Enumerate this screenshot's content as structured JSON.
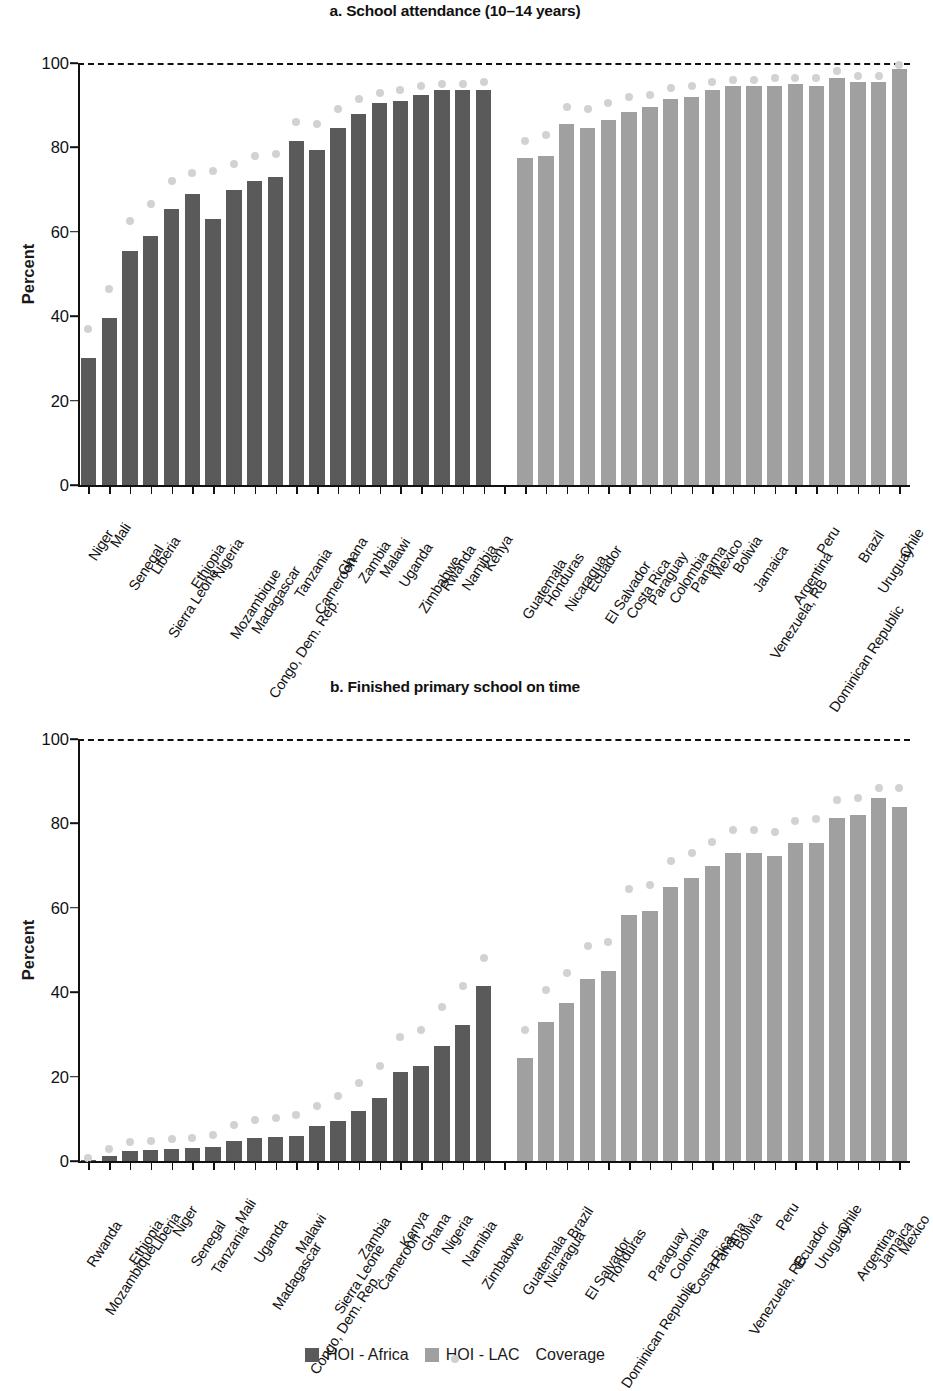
{
  "figure": {
    "ylabel": "Percent",
    "yticks": [
      "0",
      "20",
      "40",
      "60",
      "80",
      "100"
    ],
    "legend": [
      {
        "key": "africa",
        "label": "HOI - Africa",
        "color": "#5a5a5a",
        "marker": "square"
      },
      {
        "key": "lac",
        "label": "HOI - LAC",
        "color": "#a0a0a0",
        "marker": "square"
      },
      {
        "key": "coverage",
        "label": "Coverage",
        "color": "#cfcfcf",
        "marker": "dot"
      }
    ]
  },
  "chart_data": [
    {
      "type": "bar",
      "id": "panel-a",
      "title": "a. School attendance (10–14 years)",
      "xlabel": "",
      "ylabel": "Percent",
      "ylim": [
        0,
        100
      ],
      "yticks": [
        0,
        20,
        40,
        60,
        80,
        100
      ],
      "grid": false,
      "reference_line": 100,
      "legend_position": "bottom",
      "categories": [
        "Niger",
        "Mali",
        "Senegal",
        "Liberia",
        "Sierra Leone",
        "Ethiopia",
        "Nigeria",
        "Mozambique",
        "Madagascar",
        "Congo, Dem. Rep.",
        "Tanzania",
        "Cameroon",
        "Ghana",
        "Zambia",
        "Malawi",
        "Uganda",
        "Zimbabwe",
        "Rwanda",
        "Namibia",
        "Kenya",
        "",
        "Guatemala",
        "Honduras",
        "Nicaragua",
        "Ecuador",
        "El Salvador",
        "Costa Rica",
        "Paraguay",
        "Colombia",
        "Panama",
        "Mexico",
        "Bolivia",
        "Jamaica",
        "Venezuela, RB",
        "Argentina",
        "Peru",
        "Dominican Republic",
        "Brazil",
        "Uruguay",
        "Chile"
      ],
      "groups": [
        "africa",
        "africa",
        "africa",
        "africa",
        "africa",
        "africa",
        "africa",
        "africa",
        "africa",
        "africa",
        "africa",
        "africa",
        "africa",
        "africa",
        "africa",
        "africa",
        "africa",
        "africa",
        "africa",
        "africa",
        "gap",
        "lac",
        "lac",
        "lac",
        "lac",
        "lac",
        "lac",
        "lac",
        "lac",
        "lac",
        "lac",
        "lac",
        "lac",
        "lac",
        "lac",
        "lac",
        "lac",
        "lac",
        "lac",
        "lac"
      ],
      "series": [
        {
          "name": "HOI",
          "values": [
            30.0,
            39.5,
            55.5,
            59.0,
            65.5,
            69.0,
            63.0,
            70.0,
            72.0,
            73.0,
            81.5,
            79.5,
            84.5,
            88.0,
            90.5,
            91.0,
            92.5,
            93.5,
            93.5,
            93.5,
            null,
            77.5,
            78.0,
            85.5,
            84.5,
            86.5,
            88.5,
            89.5,
            91.5,
            92.0,
            93.5,
            94.5,
            94.5,
            94.5,
            95.0,
            94.5,
            96.5,
            95.5,
            95.5,
            98.5
          ]
        },
        {
          "name": "Coverage",
          "values": [
            37.0,
            46.5,
            62.5,
            66.5,
            72.0,
            74.0,
            74.5,
            76.0,
            78.0,
            78.5,
            86.0,
            85.5,
            89.0,
            91.5,
            93.0,
            93.5,
            94.5,
            95.0,
            95.0,
            95.5,
            null,
            81.5,
            83.0,
            89.5,
            89.0,
            90.5,
            92.0,
            92.5,
            94.0,
            94.5,
            95.5,
            96.0,
            96.0,
            96.5,
            96.5,
            96.5,
            98.0,
            97.0,
            97.0,
            99.5
          ]
        }
      ]
    },
    {
      "type": "bar",
      "id": "panel-b",
      "title": "b. Finished primary school on time",
      "xlabel": "",
      "ylabel": "Percent",
      "ylim": [
        0,
        100
      ],
      "yticks": [
        0,
        20,
        40,
        60,
        80,
        100
      ],
      "grid": false,
      "reference_line": 100,
      "legend_position": "bottom",
      "categories": [
        "Rwanda",
        "Mozambique",
        "Ethiopia",
        "Liberia",
        "Niger",
        "Senegal",
        "Tanzania",
        "Mali",
        "Uganda",
        "Madagascar",
        "Malawi",
        "Congo, Dem. Rep.",
        "Sierra Leone",
        "Zambia",
        "Cameroon",
        "Kenya",
        "Ghana",
        "Nigeria",
        "Namibia",
        "Zimbabwe",
        "",
        "Guatemala",
        "Nicaragua",
        "Brazil",
        "El Salvador",
        "Honduras",
        "Dominican Republic",
        "Paraguay",
        "Colombia",
        "Costa Rica",
        "Panama",
        "Bolivia",
        "Venezuela, RB",
        "Peru",
        "Ecuador",
        "Uruguay",
        "Chile",
        "Argentina",
        "Jamaica",
        "Mexico"
      ],
      "groups": [
        "africa",
        "africa",
        "africa",
        "africa",
        "africa",
        "africa",
        "africa",
        "africa",
        "africa",
        "africa",
        "africa",
        "africa",
        "africa",
        "africa",
        "africa",
        "africa",
        "africa",
        "africa",
        "africa",
        "africa",
        "gap",
        "lac",
        "lac",
        "lac",
        "lac",
        "lac",
        "lac",
        "lac",
        "lac",
        "lac",
        "lac",
        "lac",
        "lac",
        "lac",
        "lac",
        "lac",
        "lac",
        "lac",
        "lac",
        "lac"
      ],
      "series": [
        {
          "name": "HOI",
          "values": [
            0.3,
            1.3,
            2.3,
            2.6,
            2.8,
            3.0,
            3.3,
            4.8,
            5.5,
            5.6,
            6.0,
            8.3,
            9.5,
            11.8,
            15.0,
            21.0,
            22.5,
            27.3,
            32.3,
            41.5,
            null,
            24.3,
            33.0,
            37.5,
            43.2,
            45.0,
            58.3,
            59.3,
            65.0,
            67.0,
            70.0,
            73.0,
            73.0,
            72.2,
            75.3,
            75.3,
            81.3,
            82.0,
            86.0,
            84.0
          ]
        },
        {
          "name": "Coverage",
          "values": [
            0.6,
            2.8,
            4.5,
            4.8,
            5.2,
            5.4,
            6.2,
            8.6,
            9.8,
            10.2,
            11.0,
            13.0,
            15.5,
            18.5,
            22.5,
            29.5,
            31.0,
            36.5,
            41.5,
            48.0,
            null,
            31.0,
            40.5,
            44.5,
            51.0,
            52.0,
            64.5,
            65.5,
            71.0,
            73.0,
            75.5,
            78.5,
            78.5,
            78.0,
            80.5,
            81.0,
            85.5,
            86.0,
            88.5,
            88.5
          ]
        }
      ]
    }
  ]
}
